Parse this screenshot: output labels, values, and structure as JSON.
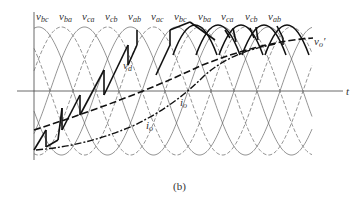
{
  "figure": {
    "caption": "(b)",
    "axis_label_t": "t",
    "phase_labels": [
      {
        "base": "v",
        "sub": "bc",
        "x": 36
      },
      {
        "base": "v",
        "sub": "ba",
        "x": 59
      },
      {
        "base": "v",
        "sub": "ca",
        "x": 82
      },
      {
        "base": "v",
        "sub": "cb",
        "x": 105
      },
      {
        "base": "v",
        "sub": "ab",
        "x": 128
      },
      {
        "base": "v",
        "sub": "ac",
        "x": 151
      },
      {
        "base": "v",
        "sub": "bc",
        "x": 174
      },
      {
        "base": "v",
        "sub": "ba",
        "x": 198
      },
      {
        "base": "v",
        "sub": "ca",
        "x": 221
      },
      {
        "base": "v",
        "sub": "cb",
        "x": 245
      },
      {
        "base": "v",
        "sub": "ab",
        "x": 268
      }
    ],
    "signal_labels": {
      "vd": {
        "base": "v",
        "sub": "d"
      },
      "io_left": {
        "base": "i",
        "sub": "o"
      },
      "io_right": {
        "base": "i",
        "sub": "o"
      },
      "vo_prime": {
        "base": "v",
        "sub": "o",
        "sup": "′"
      }
    },
    "colors": {
      "thin": "#555555",
      "thick": "#111111",
      "axis": "#444444"
    }
  }
}
